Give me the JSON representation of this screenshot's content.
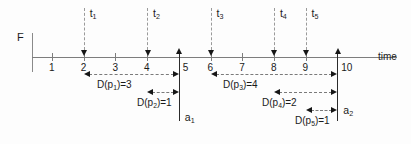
{
  "diagram": {
    "axis_label": "time",
    "origin_label": "F",
    "tick_labels": [
      "1",
      "2",
      "3",
      "4",
      "5",
      "6",
      "7",
      "8",
      "9",
      "10"
    ],
    "tick_values": [
      1,
      2,
      3,
      4,
      5,
      6,
      7,
      8,
      9,
      10
    ]
  },
  "events": [
    {
      "name": "t1",
      "label": "t",
      "sub": "1",
      "time": 2
    },
    {
      "name": "t2",
      "label": "t",
      "sub": "2",
      "time": 4
    },
    {
      "name": "t3",
      "label": "t",
      "sub": "3",
      "time": 6
    },
    {
      "name": "t4",
      "label": "t",
      "sub": "4",
      "time": 8
    },
    {
      "name": "t5",
      "label": "t",
      "sub": "5",
      "time": 9
    }
  ],
  "anchors": [
    {
      "name": "a1",
      "label": "a",
      "sub": "1",
      "time": 5
    },
    {
      "name": "a2",
      "label": "a",
      "sub": "2",
      "time": 10
    }
  ],
  "durations": [
    {
      "name": "Dp1",
      "prefix": "D(p",
      "sub": "1",
      "suffix": ")=3",
      "from": 2,
      "to": 5,
      "value": 3
    },
    {
      "name": "Dp2",
      "prefix": "D(p",
      "sub": "2",
      "suffix": ")=1",
      "from": 4,
      "to": 5,
      "value": 1
    },
    {
      "name": "Dp3",
      "prefix": "D(p",
      "sub": "3",
      "suffix": ")=4",
      "from": 6,
      "to": 10,
      "value": 4
    },
    {
      "name": "Dp4",
      "prefix": "D(p",
      "sub": "4",
      "suffix": ")=2",
      "from": 8,
      "to": 10,
      "value": 2
    },
    {
      "name": "Dp5",
      "prefix": "D(p",
      "sub": "5",
      "suffix": ")=1",
      "from": 9,
      "to": 10,
      "value": 1
    }
  ],
  "colors": {
    "axis": "#7d7d7d",
    "arrow": "#161616",
    "dash": "#9a9a9a",
    "text": "#1a1a1a",
    "background": "#fdfdfd"
  }
}
